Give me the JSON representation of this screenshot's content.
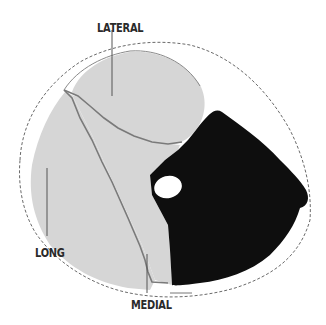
{
  "diagram": {
    "type": "anatomical-cross-section",
    "colors": {
      "background": "#ffffff",
      "light_region": "#d6d6d6",
      "boundary_line": "#7a7a7a",
      "dark_region": "#0e0e0e",
      "inner_oval": "#ffffff",
      "dashed_outline": "#6a6a6a",
      "label_text": "#2a2a2a",
      "leader_line": "#555555"
    },
    "labels": {
      "lateral": "LATERAL",
      "long": "LONG",
      "medial": "MEDIAL"
    }
  }
}
